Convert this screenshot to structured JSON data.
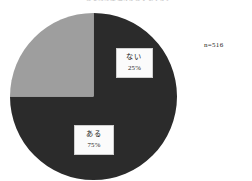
{
  "figure": {
    "title": "「あなたには悩みがありますか」",
    "sample_note": "n=516"
  },
  "labels": {
    "nai": {
      "name": "ない",
      "percent": "25%"
    },
    "aru": {
      "name": "ある",
      "percent": "75%"
    }
  },
  "chart_data": {
    "type": "pie",
    "title": "「あなたには悩みがありますか」",
    "categories": [
      "ある",
      "ない"
    ],
    "values": [
      75,
      25
    ],
    "value_labels": [
      "75%",
      "25%"
    ],
    "unit": "%",
    "total_n": 516,
    "annotations": [
      "n=516"
    ],
    "legend": "none",
    "start_angle_deg": 0,
    "direction": "clockwise",
    "grid": false,
    "slices": [
      {
        "label": "ある",
        "value": 75,
        "value_label": "75%",
        "color": "#2b2b2b",
        "start_angle_deg": 90,
        "end_angle_deg": 360
      },
      {
        "label": "ない",
        "value": 25,
        "value_label": "25%",
        "color": "#9e9e9e",
        "start_angle_deg": 0,
        "end_angle_deg": 90
      }
    ]
  },
  "colors": {
    "slice_dark": "#2b2b2b",
    "slice_light": "#9e9e9e",
    "label_box_background": "#fbfbfb",
    "label_box_border": "#cfcfcf",
    "background": "#ffffff",
    "text": "#1a1a1a"
  }
}
